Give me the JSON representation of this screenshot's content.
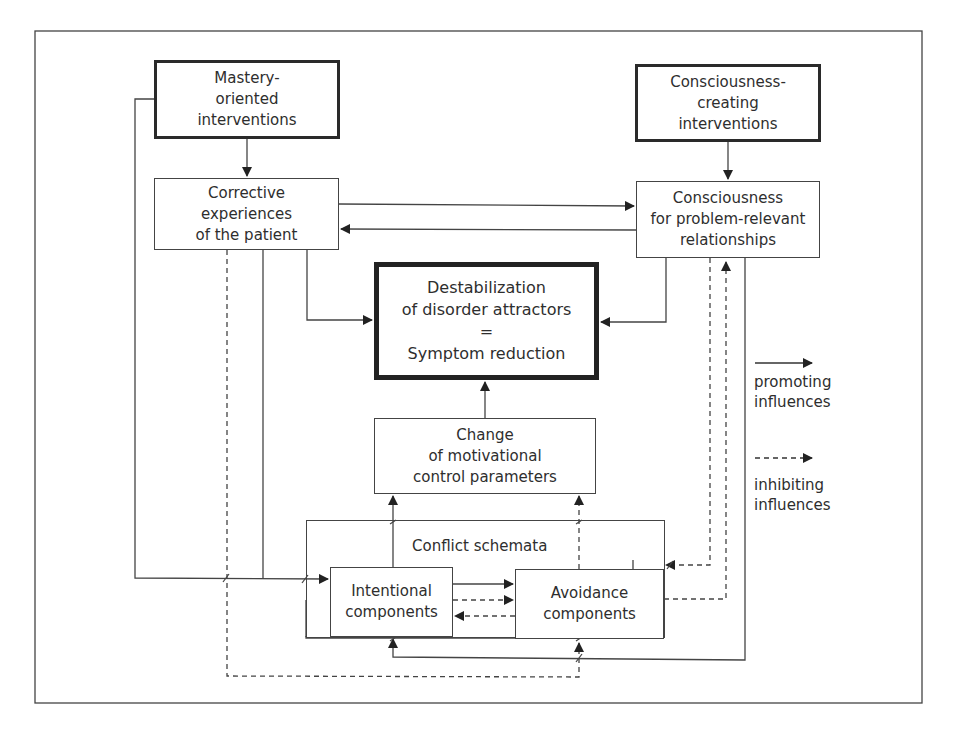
{
  "diagram": {
    "nodes": {
      "mastery": "Mastery-\noriented\ninterventions",
      "consciousness_creating": "Consciousness-\ncreating\ninterventions",
      "corrective": "Corrective\nexperiences\nof the patient",
      "consciousness": "Consciousness\nfor problem-relevant\nrelationships",
      "destabilization": "Destabilization\nof disorder attractors\n=\nSymptom reduction",
      "change": "Change\nof motivational\ncontrol parameters",
      "conflict_schemata": "Conflict schemata",
      "intentional": "Intentional\ncomponents",
      "avoidance": "Avoidance\ncomponents"
    },
    "legend": {
      "promoting": "promoting\ninfluences",
      "inhibiting": "inhibiting\ninfluences"
    },
    "edges": [
      {
        "from": "mastery",
        "to": "corrective",
        "type": "promoting"
      },
      {
        "from": "consciousness_creating",
        "to": "consciousness",
        "type": "promoting"
      },
      {
        "from": "corrective",
        "to": "consciousness",
        "type": "promoting"
      },
      {
        "from": "consciousness",
        "to": "corrective",
        "type": "promoting"
      },
      {
        "from": "corrective",
        "to": "destabilization",
        "type": "promoting"
      },
      {
        "from": "consciousness",
        "to": "destabilization",
        "type": "promoting"
      },
      {
        "from": "change",
        "to": "destabilization",
        "type": "promoting"
      },
      {
        "from": "intentional",
        "to": "change",
        "type": "promoting"
      },
      {
        "from": "avoidance",
        "to": "change",
        "type": "inhibiting"
      },
      {
        "from": "intentional",
        "to": "avoidance",
        "type": "promoting"
      },
      {
        "from": "intentional",
        "to": "avoidance",
        "type": "inhibiting"
      },
      {
        "from": "avoidance",
        "to": "intentional",
        "type": "inhibiting"
      },
      {
        "from": "mastery",
        "to": "intentional",
        "type": "promoting"
      },
      {
        "from": "corrective",
        "to": "intentional",
        "type": "promoting"
      },
      {
        "from": "corrective",
        "to": "avoidance",
        "type": "inhibiting"
      },
      {
        "from": "consciousness",
        "to": "avoidance",
        "type": "inhibiting"
      },
      {
        "from": "avoidance",
        "to": "consciousness",
        "type": "inhibiting"
      },
      {
        "from": "consciousness",
        "to": "intentional",
        "type": "promoting"
      },
      {
        "from": "corrective",
        "to": "avoidance",
        "type": "promoting"
      }
    ]
  }
}
